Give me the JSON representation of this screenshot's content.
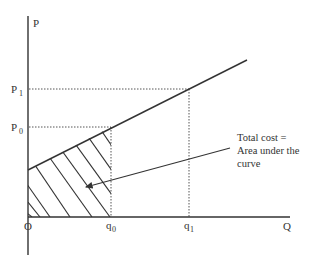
{
  "diagram": {
    "axes": {
      "y_label": "P",
      "x_label": "Q",
      "origin_label": "O"
    },
    "price_levels": [
      {
        "base": "P",
        "sub": "1"
      },
      {
        "base": "P",
        "sub": "0"
      }
    ],
    "quantity_levels": [
      {
        "base": "q",
        "sub": "0"
      },
      {
        "base": "q",
        "sub": "1"
      }
    ],
    "annotation": {
      "line1": "Total cost =",
      "line2": "Area under the",
      "line3": "curve"
    },
    "colors": {
      "line": "#333333",
      "dotted": "#555555",
      "background": "#ffffff"
    }
  }
}
